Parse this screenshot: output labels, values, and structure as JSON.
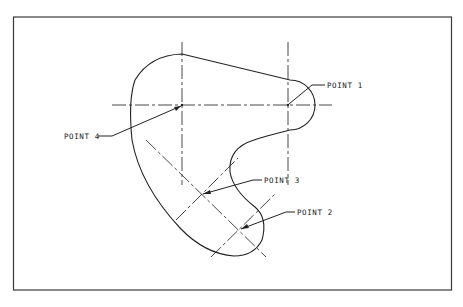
{
  "drawing": {
    "type": "cam-profile technical drawing",
    "labels": {
      "point1": "POINT 1",
      "point2": "POINT 2",
      "point3": "POINT 3",
      "point4": "POINT 4"
    }
  },
  "colors": {
    "background": "#ffffff",
    "line": "#222222"
  }
}
